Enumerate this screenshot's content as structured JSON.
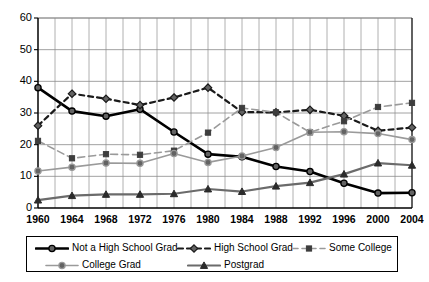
{
  "chart_data": {
    "type": "line",
    "title": "",
    "subtitle": "",
    "xlabel": "",
    "ylabel": "",
    "x": [
      1960,
      1964,
      1968,
      1972,
      1976,
      1980,
      1984,
      1988,
      1992,
      1996,
      2000,
      2004
    ],
    "categories": [
      "1960",
      "1964",
      "1968",
      "1972",
      "1976",
      "1980",
      "1984",
      "1988",
      "1992",
      "1996",
      "2000",
      "2004"
    ],
    "xlim": [
      1960,
      2004
    ],
    "ylim": [
      0,
      60
    ],
    "yticks": [
      0,
      10,
      20,
      30,
      40,
      50,
      60
    ],
    "ytick_labels": [
      "0",
      "10",
      "20",
      "30",
      "40",
      "50",
      "60"
    ],
    "xtick_labels": [
      "1960",
      "1964",
      "1968",
      "1972",
      "1976",
      "1980",
      "1984",
      "1988",
      "1992",
      "1996",
      "2000",
      "2004"
    ],
    "minor_x_gridline_interval": 2,
    "grid": true,
    "legend_position": "bottom",
    "series": [
      {
        "name": "Not a High School Grad",
        "values": [
          38.0,
          30.6,
          29.0,
          31.2,
          24.0,
          17.0,
          16.2,
          13.1,
          11.5,
          7.8,
          4.7,
          4.8
        ],
        "color": "#000000",
        "line_style": "solid",
        "line_width": 2.6,
        "marker": "circle"
      },
      {
        "name": "High School Grad",
        "values": [
          26.0,
          36.1,
          34.5,
          32.5,
          34.9,
          38.0,
          30.3,
          30.2,
          31.0,
          29.1,
          24.4,
          25.4
        ],
        "color": "#1a1a1a",
        "line_style": "dashed",
        "line_width": 2.2,
        "marker": "diamond"
      },
      {
        "name": "Some College",
        "values": [
          21.2,
          15.7,
          17.0,
          16.8,
          18.1,
          23.8,
          31.6,
          30.2,
          23.9,
          27.4,
          31.9,
          33.2
        ],
        "color": "#9a9a9a",
        "line_style": "dashed",
        "line_width": 1.6,
        "marker": "square"
      },
      {
        "name": "College Grad",
        "values": [
          11.7,
          12.9,
          14.2,
          14.1,
          17.2,
          14.4,
          16.4,
          19.1,
          23.9,
          24.1,
          23.5,
          21.6
        ],
        "color": "#9a9a9a",
        "line_style": "solid",
        "line_width": 1.6,
        "marker": "circle"
      },
      {
        "name": "Postgrad",
        "values": [
          2.5,
          3.9,
          4.3,
          4.3,
          4.5,
          6.0,
          5.2,
          6.9,
          8.0,
          10.7,
          14.2,
          13.5
        ],
        "color": "#6b6b6b",
        "line_style": "solid",
        "line_width": 2.2,
        "marker": "triangle"
      }
    ]
  },
  "legend": {
    "items": [
      {
        "label": "Not a High School Grad"
      },
      {
        "label": "High School Grad"
      },
      {
        "label": "Some College"
      },
      {
        "label": "College Grad"
      },
      {
        "label": "Postgrad"
      }
    ]
  },
  "colors": {
    "axis": "#000000",
    "grid_major": "#8a8a8a",
    "grid_minor": "#9d9d9d",
    "background": "#ffffff"
  }
}
